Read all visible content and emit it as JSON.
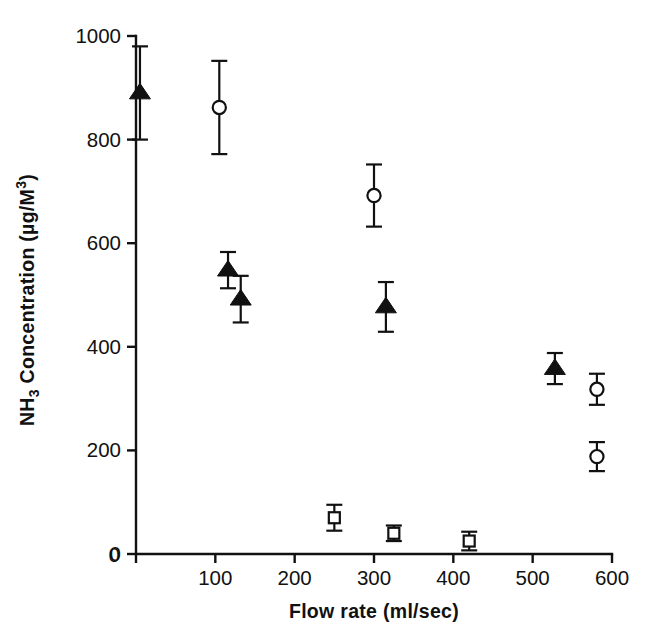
{
  "chart_data": {
    "type": "scatter",
    "title": "",
    "subtitle": "",
    "xlabel": "Flow rate (ml/sec)",
    "ylabel_parts": {
      "prefix": "NH",
      "subscript": "3",
      "middle": " Concentration (μg/M",
      "superscript": "3",
      "suffix": ")"
    },
    "ylabel": "NH3 Concentration (μg/M3)",
    "xlim": [
      0,
      600
    ],
    "ylim": [
      0,
      1000
    ],
    "xticks": [
      0,
      100,
      200,
      300,
      400,
      500,
      600
    ],
    "xtick_labels": [
      "0",
      "100",
      "200",
      "300",
      "400",
      "500",
      "600"
    ],
    "yticks": [
      0,
      200,
      400,
      600,
      800,
      1000
    ],
    "ytick_labels": [
      "0",
      "200",
      "400",
      "600",
      "800",
      "1000"
    ],
    "grid": false,
    "legend": "none",
    "errorbars": "symmetric-sd",
    "series": [
      {
        "name": "filled-triangle",
        "marker": "filled-triangle",
        "points": [
          {
            "x": 5,
            "y": 890,
            "err": 90
          },
          {
            "x": 116,
            "y": 548,
            "err": 35
          },
          {
            "x": 132,
            "y": 492,
            "err": 45
          },
          {
            "x": 315,
            "y": 477,
            "err": 48
          },
          {
            "x": 528,
            "y": 358,
            "err": 30
          }
        ]
      },
      {
        "name": "open-circle",
        "marker": "open-circle",
        "points": [
          {
            "x": 105,
            "y": 862,
            "err": 90
          },
          {
            "x": 300,
            "y": 692,
            "err": 60
          },
          {
            "x": 581,
            "y": 318,
            "err": 30
          },
          {
            "x": 581,
            "y": 188,
            "err": 28
          }
        ]
      },
      {
        "name": "open-square",
        "marker": "open-square",
        "points": [
          {
            "x": 250,
            "y": 70,
            "err": 25
          },
          {
            "x": 325,
            "y": 40,
            "err": 15
          },
          {
            "x": 420,
            "y": 25,
            "err": 18
          }
        ]
      }
    ],
    "colors": {
      "foreground": "#111111",
      "background": "#ffffff",
      "marker_fill_open": "#ffffff",
      "marker_fill_solid": "#111111"
    }
  }
}
